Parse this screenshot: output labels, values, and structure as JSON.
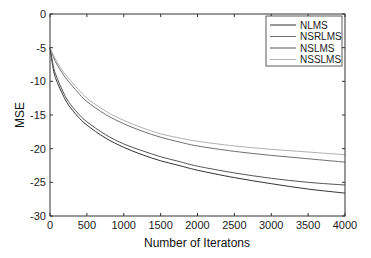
{
  "chart_data": {
    "type": "line",
    "title": "",
    "xlabel": "Number of Iteratons",
    "ylabel": "MSE",
    "xlim": [
      0,
      4000
    ],
    "ylim": [
      -30,
      0
    ],
    "xticks": [
      0,
      500,
      1000,
      1500,
      2000,
      2500,
      3000,
      3500,
      4000
    ],
    "yticks": [
      0,
      -5,
      -10,
      -15,
      -20,
      -25,
      -30
    ],
    "grid": false,
    "legend_position": "upper right",
    "x": [
      0,
      50,
      100,
      175,
      250,
      375,
      500,
      750,
      1000,
      1250,
      1500,
      1750,
      2000,
      2500,
      3000,
      3500,
      4000
    ],
    "series": [
      {
        "name": "NLMS",
        "color": "#333333",
        "values": [
          -5,
          -8.5,
          -10.2,
          -12,
          -13.5,
          -15.2,
          -16.5,
          -18.4,
          -19.8,
          -20.9,
          -21.8,
          -22.5,
          -23.2,
          -24.3,
          -25.2,
          -26.0,
          -26.6
        ]
      },
      {
        "name": "NSRLMS",
        "color": "#6e6e6e",
        "values": [
          -5,
          -6.5,
          -7.6,
          -8.9,
          -10.0,
          -11.6,
          -13.0,
          -14.9,
          -16.3,
          -17.4,
          -18.3,
          -19.0,
          -19.6,
          -20.4,
          -21.0,
          -21.5,
          -22.0
        ]
      },
      {
        "name": "NSLMS",
        "color": "#555555",
        "values": [
          -5,
          -8.0,
          -9.6,
          -11.5,
          -13.0,
          -14.7,
          -16.0,
          -17.9,
          -19.3,
          -20.3,
          -21.2,
          -21.9,
          -22.6,
          -23.6,
          -24.4,
          -25.0,
          -25.4
        ]
      },
      {
        "name": "NSSLMS",
        "color": "#b0b0b0",
        "values": [
          -5,
          -6.2,
          -7.2,
          -8.5,
          -9.5,
          -11.1,
          -12.5,
          -14.4,
          -15.8,
          -16.9,
          -17.8,
          -18.4,
          -18.9,
          -19.6,
          -20.1,
          -20.5,
          -20.9
        ]
      }
    ]
  }
}
